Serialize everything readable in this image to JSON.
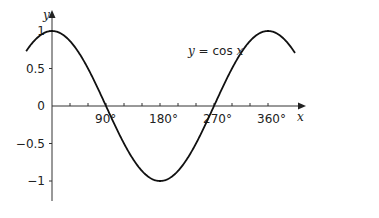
{
  "chart_data": {
    "type": "line",
    "title": "",
    "xlabel": "x",
    "ylabel": "y",
    "xlim": [
      -43,
      405
    ],
    "ylim": [
      -1.25,
      1.3
    ],
    "grid": false,
    "legend": null,
    "x_unit": "degrees",
    "x_ticks": [
      30,
      60,
      90,
      120,
      150,
      180,
      210,
      240,
      270,
      300,
      330,
      360
    ],
    "x_tick_labels": [
      {
        "value": 90,
        "label": "90°"
      },
      {
        "value": 180,
        "label": "180°"
      },
      {
        "value": 270,
        "label": "270°"
      },
      {
        "value": 360,
        "label": "360°"
      }
    ],
    "y_tick_labels": [
      {
        "value": 1,
        "label": "1"
      },
      {
        "value": 0.5,
        "label": "0.5"
      },
      {
        "value": 0,
        "label": "0"
      },
      {
        "value": -0.5,
        "label": "−0.5"
      },
      {
        "value": -1,
        "label": "−1"
      }
    ],
    "series": [
      {
        "name": "y = cos x",
        "function": "cos",
        "x": [
          -43,
          -30,
          0,
          30,
          60,
          90,
          120,
          150,
          180,
          210,
          240,
          270,
          300,
          330,
          360,
          390,
          405
        ],
        "values": [
          0.73,
          0.87,
          1,
          0.87,
          0.5,
          0,
          -0.5,
          -0.87,
          -1,
          -0.87,
          -0.5,
          0,
          0.5,
          0.87,
          1,
          0.87,
          0.71
        ]
      }
    ],
    "annotations": [
      {
        "text_prefix": "y",
        "text_middle": " = cos ",
        "text_suffix": "x",
        "position": "above curve near x≈255°"
      }
    ],
    "colors": {
      "curve": "#111111",
      "axes": "#333333",
      "text": "#222222"
    }
  },
  "labels": {
    "y_axis": "y",
    "x_axis": "x",
    "curve_prefix": "y",
    "curve_middle": " = cos ",
    "curve_suffix": "x"
  }
}
